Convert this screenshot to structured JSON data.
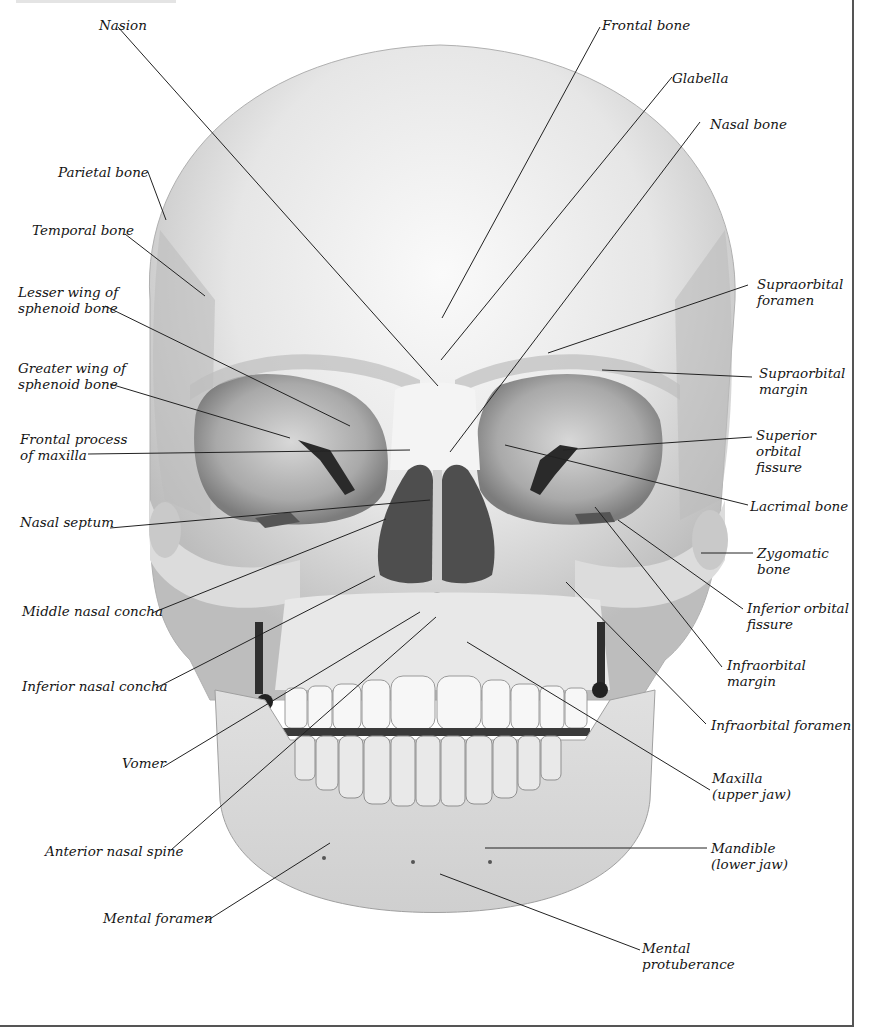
{
  "figure": {
    "colors": {
      "bone_light": "#f2f2f2",
      "bone_mid": "#c9c9c9",
      "bone_dark": "#8a8a8a",
      "cavity": "#4a4a4a",
      "leader_line": "#222222",
      "border": "#555555"
    }
  },
  "labels": {
    "nasion": "Nasion",
    "frontal_bone": "Frontal bone",
    "glabella": "Glabella",
    "nasal_bone": "Nasal bone",
    "parietal_bone": "Parietal bone",
    "temporal_bone": "Temporal bone",
    "lesser_wing": "Lesser wing of\nsphenoid bone",
    "greater_wing": "Greater wing of\nsphenoid bone",
    "frontal_process": "Frontal process\nof maxilla",
    "nasal_septum": "Nasal septum",
    "middle_nasal_concha": "Middle nasal concha",
    "inferior_nasal_concha": "Inferior nasal concha",
    "vomer": "Vomer",
    "anterior_nasal_spine": "Anterior nasal spine",
    "mental_foramen": "Mental foramen",
    "supraorbital_foramen": "Supraorbital\nforamen",
    "supraorbital_margin": "Supraorbital\nmargin",
    "superior_orbital_fissure": "Superior\norbital\nfissure",
    "lacrimal_bone": "Lacrimal bone",
    "zygomatic_bone": "Zygomatic\nbone",
    "inferior_orbital_fissure": "Inferior orbital\nfissure",
    "infraorbital_margin": "Infraorbital\nmargin",
    "infraorbital_foramen": "Infraorbital foramen",
    "maxilla": "Maxilla\n(upper jaw)",
    "mandible": "Mandible\n(lower jaw)",
    "mental_protuberance": "Mental\nprotuberance"
  }
}
